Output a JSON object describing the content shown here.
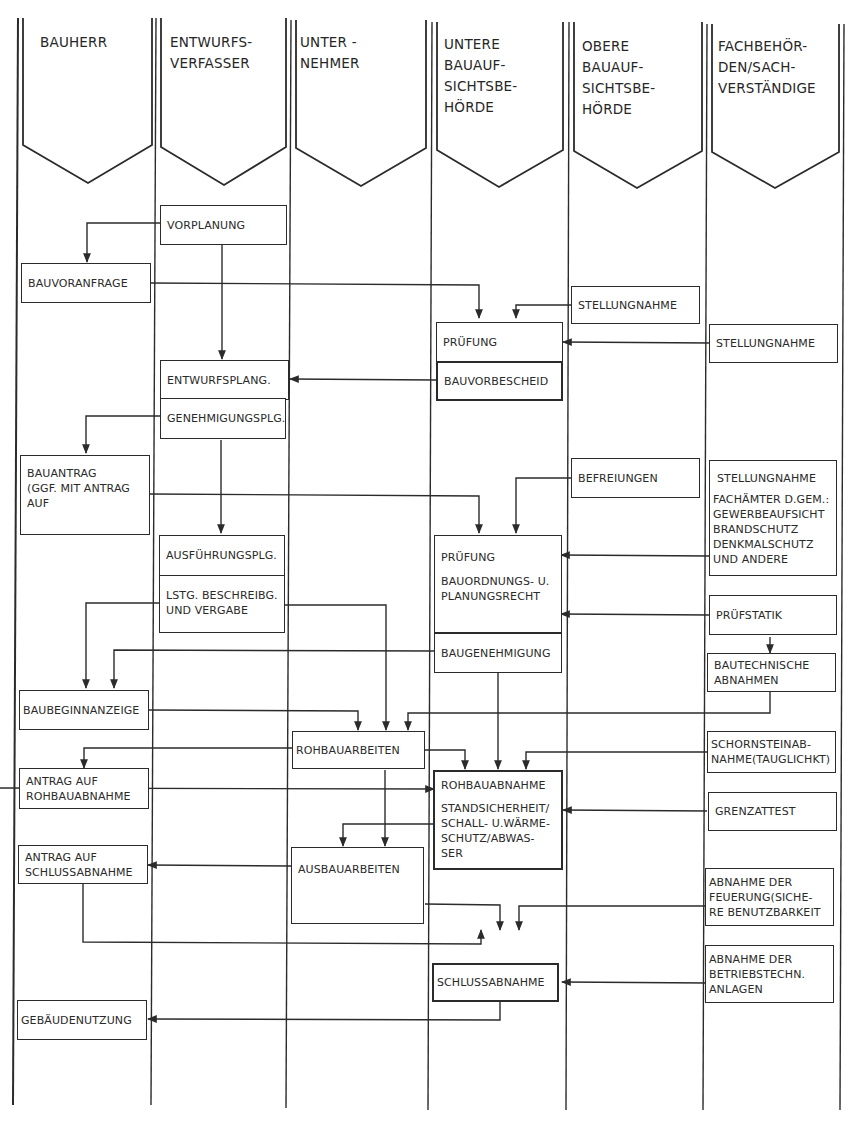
{
  "lanes": [
    {
      "id": "bauherr",
      "title": "BAUHERR"
    },
    {
      "id": "entwurfsverfasser",
      "title": "ENTWURFS-\nVERFASSER"
    },
    {
      "id": "unternehmer",
      "title": "UNTER -\nNEHMER"
    },
    {
      "id": "untere_bauaufsichtsbehoerde",
      "title": "UNTERE\nBAUAUF-\nSICHTSBE-\nHÖRDE"
    },
    {
      "id": "obere_bauaufsichtsbehoerde",
      "title": "OBERE\nBAUAUF-\nSICHTSBE-\nHÖRDE"
    },
    {
      "id": "fachbehoerden",
      "title": "FACHBEHÖR-\nDEN/SACH-\nVERSTÄNDIGE"
    }
  ],
  "boxes": {
    "vorplanung": {
      "lane": "entwurfsverfasser",
      "label": "VORPLANUNG"
    },
    "bauvoranfrage": {
      "lane": "bauherr",
      "label": "BAUVORANFRAGE"
    },
    "stellungnahme_obere": {
      "lane": "obere_bauaufsichtsbehoerde",
      "label": "STELLUNGNAHME"
    },
    "pruefung_1": {
      "lane": "untere_bauaufsichtsbehoerde",
      "label": "PRÜFUNG"
    },
    "stellungnahme_fach_1": {
      "lane": "fachbehoerden",
      "label": "STELLUNGNAHME"
    },
    "entwurfsplang": {
      "lane": "entwurfsverfasser",
      "label": "ENTWURFSPLANG."
    },
    "bauvorbescheid": {
      "lane": "untere_bauaufsichtsbehoerde",
      "label": "BAUVORBESCHEID"
    },
    "genehmigungsplg": {
      "lane": "entwurfsverfasser",
      "label": "GENEHMIGUNGSPLG."
    },
    "bauantrag": {
      "lane": "bauherr",
      "label": "BAUANTRAG\n(GGF. MIT ANTRAG\nAUF"
    },
    "befreiungen": {
      "lane": "obere_bauaufsichtsbehoerde",
      "label": "BEFREIUNGEN"
    },
    "stellungnahme_fach_2": {
      "lane": "fachbehoerden",
      "label": "STELLUNGNAHME",
      "sub": "FACHÄMTER D.GEM.:\nGEWERBEAUFSICHT\nBRANDSCHUTZ\nDENKMALSCHUTZ\nUND ANDERE"
    },
    "ausfuehrungsplg": {
      "lane": "entwurfsverfasser",
      "label": "AUSFÜHRUNGSPLG."
    },
    "pruefung_2": {
      "lane": "untere_bauaufsichtsbehoerde",
      "label": "PRÜFUNG",
      "sub": "BAUORDNUNGS- U.\nPLANUNGSRECHT"
    },
    "lstg_beschreibg": {
      "lane": "entwurfsverfasser",
      "label": "LSTG. BESCHREIBG.\nUND VERGABE"
    },
    "pruefstatik": {
      "lane": "fachbehoerden",
      "label": "PRÜFSTATIK"
    },
    "baugenehmigung": {
      "lane": "untere_bauaufsichtsbehoerde",
      "label": "BAUGENEHMIGUNG"
    },
    "bautechnische_abnahmen": {
      "lane": "fachbehoerden",
      "label": "BAUTECHNISCHE\nABNAHMEN"
    },
    "baubeginnanzeige": {
      "lane": "bauherr",
      "label": "BAUBEGINNANZEIGE"
    },
    "rohbauarbeiten": {
      "lane": "unternehmer",
      "label": "ROHBAUARBEITEN"
    },
    "schornsteinabnahme": {
      "lane": "fachbehoerden",
      "label": "SCHORNSTEINAB-\nNAHME(TAUGLICHKT)"
    },
    "antrag_rohbauabnahme": {
      "lane": "bauherr",
      "label": "ANTRAG AUF\nROHBAUABNAHME"
    },
    "rohbauabnahme": {
      "lane": "untere_bauaufsichtsbehoerde",
      "label": "ROHBAUABNAHME",
      "sub": "STANDSICHERHEIT/\nSCHALL- U.WÄRME-\nSCHUTZ/ABWAS-\nSER"
    },
    "grenzattest": {
      "lane": "fachbehoerden",
      "label": "GRENZATTEST"
    },
    "antrag_schlussabnahme": {
      "lane": "bauherr",
      "label": "ANTRAG AUF\nSCHLUSSABNAHME"
    },
    "ausbauarbeiten": {
      "lane": "unternehmer",
      "label": "AUSBAUARBEITEN"
    },
    "abnahme_feuerung": {
      "lane": "fachbehoerden",
      "label": "ABNAHME DER\nFEUERUNG(SICHE-\nRE BENUTZBARKEIT"
    },
    "schlussabnahme": {
      "lane": "untere_bauaufsichtsbehoerde",
      "label": "SCHLUSSABNAHME"
    },
    "abnahme_betriebstechn": {
      "lane": "fachbehoerden",
      "label": "ABNAHME DER\nBETRIEBSTECHN.\nANLAGEN"
    },
    "gebaeudenutzung": {
      "lane": "bauherr",
      "label": "GEBÄUDENUTZUNG"
    }
  },
  "colors": {
    "ink": "#2b2b2b",
    "paper": "#ffffff"
  }
}
